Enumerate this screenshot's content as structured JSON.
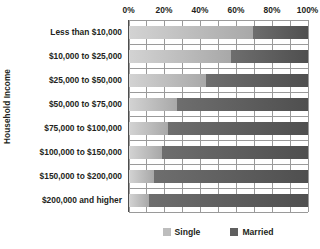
{
  "chart_data": {
    "type": "bar",
    "subtype": "stacked-horizontal-100pct",
    "title": "",
    "xlabel": "",
    "ylabel": "Household Income",
    "xlim": [
      0,
      100
    ],
    "xticks": [
      0,
      20,
      40,
      60,
      80,
      100
    ],
    "xticklabels": [
      "0%",
      "20%",
      "40%",
      "60%",
      "80%",
      "100%"
    ],
    "gridline_interval": 10,
    "grid": true,
    "legend_position": "bottom",
    "categories": [
      "Less than $10,000",
      "$10,000 to $25,000",
      "$25,000 to $50,000",
      "$50,000 to $75,000",
      "$75,000 to $100,000",
      "$100,000 to $150,000",
      "$150,000 to $200,000",
      "$200,000 and higher"
    ],
    "series": [
      {
        "name": "Single",
        "color": "#bdbdbd",
        "values": [
          69,
          57,
          43,
          27,
          22,
          18.5,
          14,
          11
        ]
      },
      {
        "name": "Married",
        "color": "#5f5f5f",
        "values": [
          31,
          43,
          57,
          73,
          78,
          81.5,
          86,
          89
        ]
      }
    ]
  },
  "legend": {
    "items": [
      {
        "label": "Single",
        "color": "#bdbdbd"
      },
      {
        "label": "Married",
        "color": "#5f5f5f"
      }
    ]
  },
  "colors": {
    "single": "#bdbdbd",
    "married": "#5f5f5f",
    "gridline": "#9a9a9a",
    "axis": "#4d4d4d",
    "text": "#231f20",
    "background": "#ffffff"
  }
}
